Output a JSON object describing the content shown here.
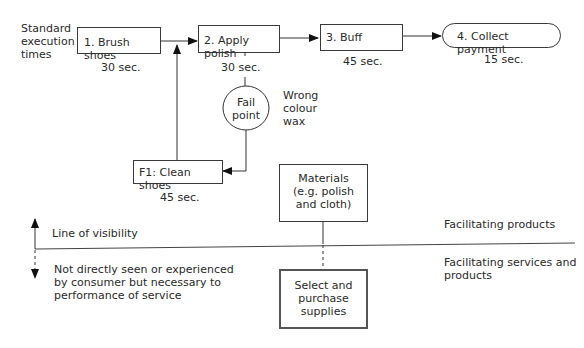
{
  "header": {
    "standard_times_label": [
      "Standard",
      "execution",
      "times"
    ]
  },
  "steps": [
    {
      "id": "1",
      "label": "1. Brush shoes",
      "time": "30 sec."
    },
    {
      "id": "2",
      "label": "2. Apply polish",
      "time": "30 sec."
    },
    {
      "id": "3",
      "label": "3. Buff",
      "time": "45 sec."
    },
    {
      "id": "4",
      "label": "4. Collect payment",
      "time": "15 sec."
    }
  ],
  "fail_point": {
    "label": [
      "Fail",
      "point"
    ],
    "note": [
      "Wrong",
      "colour",
      "wax"
    ]
  },
  "fix_step": {
    "label": "F1: Clean shoes",
    "time": "45 sec."
  },
  "materials": {
    "label": [
      "Materials",
      "(e.g. polish",
      "and cloth)"
    ]
  },
  "supplies": {
    "label": [
      "Select and",
      "purchase",
      "supplies"
    ]
  },
  "visibility": {
    "line_label": "Line of visibility",
    "below_text": [
      "Not directly seen or experienced",
      "by consumer but necessary to",
      "performance of service"
    ],
    "above_right": "Facilitating products",
    "below_right": [
      "Facilitating services and",
      "products"
    ]
  }
}
